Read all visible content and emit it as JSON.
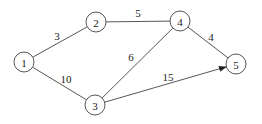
{
  "graph": {
    "nodes": [
      {
        "id": "1",
        "label": "1",
        "x": 24,
        "y": 62
      },
      {
        "id": "2",
        "label": "2",
        "x": 96,
        "y": 22
      },
      {
        "id": "3",
        "label": "3",
        "x": 95,
        "y": 105
      },
      {
        "id": "4",
        "label": "4",
        "x": 180,
        "y": 21
      },
      {
        "id": "5",
        "label": "5",
        "x": 236,
        "y": 64
      }
    ],
    "edges": [
      {
        "from": "1",
        "to": "2",
        "weight": "3",
        "directed": false,
        "label_x": 57,
        "label_y": 36
      },
      {
        "from": "1",
        "to": "3",
        "weight": "10",
        "directed": false,
        "label_x": 66,
        "label_y": 79
      },
      {
        "from": "2",
        "to": "4",
        "weight": "5",
        "directed": false,
        "label_x": 138,
        "label_y": 13
      },
      {
        "from": "3",
        "to": "4",
        "weight": "6",
        "directed": false,
        "label_x": 131,
        "label_y": 57
      },
      {
        "from": "4",
        "to": "5",
        "weight": "4",
        "directed": false,
        "label_x": 211,
        "label_y": 37
      },
      {
        "from": "3",
        "to": "5",
        "weight": "15",
        "directed": true,
        "label_x": 168,
        "label_y": 77
      }
    ],
    "node_radius": 10
  }
}
